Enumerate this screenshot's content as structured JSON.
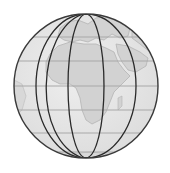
{
  "image": {
    "subject": "Globe illustration showing Africa and Europe with meridian and latitude grid lines",
    "colors": {
      "background": "#ffffff",
      "ocean": "#e6e6e6",
      "land": "#d2d2d2",
      "land_outline": "#b4b4b4",
      "meridian": "#2a2a2a",
      "parallel": "#a8a8a8",
      "rim": "#3a3a3a"
    },
    "globe": {
      "cx": 86,
      "cy": 86,
      "r": 72
    },
    "parallels_y": [
      37,
      61,
      86,
      110,
      133,
      152
    ],
    "meridians_rx": [
      72,
      50,
      18
    ]
  }
}
